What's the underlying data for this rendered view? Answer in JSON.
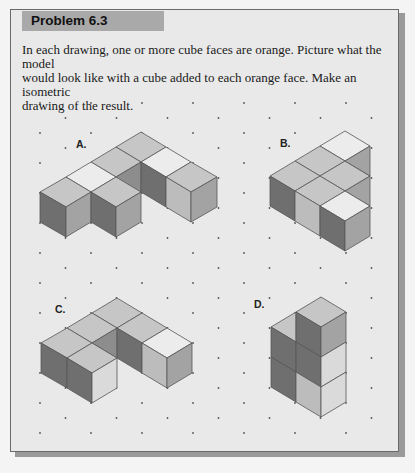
{
  "header": {
    "title": "Problem 6.3"
  },
  "instructions": {
    "line1": "In each drawing, one or more cube faces are orange. Picture what the model",
    "line2": "would look like with a cube added to each orange face. Make an isometric",
    "line3": "drawing of the result."
  },
  "colors": {
    "top": "#c6c6c6",
    "top_orange": "#ececec",
    "left_dark": "#6f6f6f",
    "right_medium": "#a3a3a3",
    "light": "#bcbcbc",
    "very_light": "#dadada",
    "mid_dark": "#8d8d8d",
    "edge": "#555555",
    "dot": "#555555"
  },
  "dot_grid": {
    "x0": 40,
    "y0": 103,
    "dx": 51,
    "dy": 15,
    "rows": 23,
    "x_max": 395
  },
  "drawings": [
    {
      "label": "A.",
      "label_pos": [
        76,
        148
      ],
      "faces": [
        {
          "c": "top",
          "p": [
            [
              141,
              132
            ],
            [
              166,
              147
            ],
            [
              141,
              162
            ],
            [
              116,
              147
            ]
          ]
        },
        {
          "c": "top",
          "p": [
            [
              116,
              147
            ],
            [
              141,
              162
            ],
            [
              116,
              177
            ],
            [
              91,
              162
            ]
          ]
        },
        {
          "c": "top_orange",
          "p": [
            [
              166,
              147
            ],
            [
              191,
              162
            ],
            [
              166,
              177
            ],
            [
              141,
              162
            ]
          ]
        },
        {
          "c": "top_orange",
          "p": [
            [
              91,
              162
            ],
            [
              116,
              177
            ],
            [
              91,
              192
            ],
            [
              66,
              177
            ]
          ]
        },
        {
          "c": "top",
          "p": [
            [
              191,
              162
            ],
            [
              217,
              177
            ],
            [
              191,
              192
            ],
            [
              166,
              177
            ]
          ]
        },
        {
          "c": "mid_dark",
          "p": [
            [
              116,
              177
            ],
            [
              141,
              162
            ],
            [
              141,
              192
            ],
            [
              116,
              207
            ]
          ]
        },
        {
          "c": "left_dark",
          "p": [
            [
              141,
              162
            ],
            [
              166,
              177
            ],
            [
              166,
              207
            ],
            [
              141,
              192
            ]
          ]
        },
        {
          "c": "light",
          "p": [
            [
              166,
              177
            ],
            [
              191,
              192
            ],
            [
              191,
              222
            ],
            [
              166,
              207
            ]
          ]
        },
        {
          "c": "right_medium",
          "p": [
            [
              191,
              192
            ],
            [
              217,
              177
            ],
            [
              217,
              207
            ],
            [
              191,
              222
            ]
          ]
        },
        {
          "c": "top",
          "p": [
            [
              66,
              177
            ],
            [
              91,
              192
            ],
            [
              66,
              207
            ],
            [
              40,
              192
            ]
          ]
        },
        {
          "c": "top",
          "p": [
            [
              116,
              177
            ],
            [
              141,
              192
            ],
            [
              116,
              207
            ],
            [
              91,
              192
            ]
          ]
        },
        {
          "c": "left_dark",
          "p": [
            [
              40,
              192
            ],
            [
              66,
              207
            ],
            [
              66,
              237
            ],
            [
              40,
              222
            ]
          ]
        },
        {
          "c": "right_medium",
          "p": [
            [
              66,
              207
            ],
            [
              91,
              192
            ],
            [
              91,
              222
            ],
            [
              66,
              237
            ]
          ]
        },
        {
          "c": "left_dark",
          "p": [
            [
              91,
              192
            ],
            [
              116,
              207
            ],
            [
              116,
              237
            ],
            [
              91,
              222
            ]
          ]
        },
        {
          "c": "right_medium",
          "p": [
            [
              116,
              207
            ],
            [
              141,
              192
            ],
            [
              141,
              222
            ],
            [
              116,
              237
            ]
          ]
        }
      ]
    },
    {
      "label": "B.",
      "label_pos": [
        280,
        147
      ],
      "faces": [
        {
          "c": "top_orange",
          "p": [
            [
              345,
              131
            ],
            [
              370,
              146
            ],
            [
              345,
              161
            ],
            [
              320,
              146
            ]
          ]
        },
        {
          "c": "top",
          "p": [
            [
              320,
              146
            ],
            [
              345,
              161
            ],
            [
              320,
              176
            ],
            [
              295,
              161
            ]
          ]
        },
        {
          "c": "top",
          "p": [
            [
              345,
              161
            ],
            [
              370,
              176
            ],
            [
              345,
              191
            ],
            [
              320,
              176
            ]
          ]
        },
        {
          "c": "right_medium",
          "p": [
            [
              345,
              161
            ],
            [
              370,
              146
            ],
            [
              370,
              176
            ]
          ]
        },
        {
          "c": "top",
          "p": [
            [
              295,
              161
            ],
            [
              320,
              176
            ],
            [
              295,
              191
            ],
            [
              270,
              176
            ]
          ]
        },
        {
          "c": "top",
          "p": [
            [
              320,
              176
            ],
            [
              345,
              191
            ],
            [
              320,
              206
            ],
            [
              295,
              191
            ]
          ]
        },
        {
          "c": "right_medium",
          "p": [
            [
              345,
              191
            ],
            [
              370,
              176
            ],
            [
              370,
              206
            ]
          ]
        },
        {
          "c": "top_orange",
          "p": [
            [
              345,
              191
            ],
            [
              370,
              206
            ],
            [
              345,
              221
            ],
            [
              320,
              206
            ]
          ]
        },
        {
          "c": "left_dark",
          "p": [
            [
              270,
              176
            ],
            [
              295,
              191
            ],
            [
              295,
              221
            ],
            [
              270,
              206
            ]
          ]
        },
        {
          "c": "light",
          "p": [
            [
              295,
              191
            ],
            [
              320,
              206
            ],
            [
              320,
              236
            ],
            [
              295,
              221
            ]
          ]
        },
        {
          "c": "left_dark",
          "p": [
            [
              320,
              206
            ],
            [
              345,
              221
            ],
            [
              345,
              251
            ],
            [
              320,
              236
            ]
          ]
        },
        {
          "c": "right_medium",
          "p": [
            [
              345,
              221
            ],
            [
              370,
              206
            ],
            [
              370,
              236
            ],
            [
              345,
              251
            ]
          ]
        }
      ]
    },
    {
      "label": "C.",
      "label_pos": [
        55,
        313
      ],
      "faces": [
        {
          "c": "top",
          "p": [
            [
              117,
              298
            ],
            [
              142,
              313
            ],
            [
              117,
              328
            ],
            [
              92,
              313
            ]
          ]
        },
        {
          "c": "top",
          "p": [
            [
              92,
              313
            ],
            [
              117,
              328
            ],
            [
              92,
              343
            ],
            [
              67,
              328
            ]
          ]
        },
        {
          "c": "top",
          "p": [
            [
              142,
              313
            ],
            [
              167,
              328
            ],
            [
              142,
              343
            ],
            [
              117,
              328
            ]
          ]
        },
        {
          "c": "mid_dark",
          "p": [
            [
              92,
              343
            ],
            [
              117,
              328
            ],
            [
              117,
              358
            ]
          ]
        },
        {
          "c": "left_dark",
          "p": [
            [
              117,
              328
            ],
            [
              142,
              343
            ],
            [
              142,
              373
            ],
            [
              117,
              358
            ]
          ]
        },
        {
          "c": "top_orange",
          "p": [
            [
              167,
              328
            ],
            [
              192,
              343
            ],
            [
              167,
              358
            ],
            [
              142,
              343
            ]
          ]
        },
        {
          "c": "light",
          "p": [
            [
              142,
              343
            ],
            [
              167,
              358
            ],
            [
              167,
              388
            ],
            [
              142,
              373
            ]
          ]
        },
        {
          "c": "right_medium",
          "p": [
            [
              167,
              358
            ],
            [
              192,
              343
            ],
            [
              192,
              373
            ],
            [
              167,
              388
            ]
          ]
        },
        {
          "c": "top",
          "p": [
            [
              67,
              328
            ],
            [
              92,
              343
            ],
            [
              67,
              358
            ],
            [
              41,
              343
            ]
          ]
        },
        {
          "c": "top",
          "p": [
            [
              92,
              343
            ],
            [
              117,
              358
            ],
            [
              92,
              373
            ],
            [
              67,
              358
            ]
          ]
        },
        {
          "c": "left_dark",
          "p": [
            [
              41,
              343
            ],
            [
              67,
              358
            ],
            [
              67,
              388
            ],
            [
              41,
              373
            ]
          ]
        },
        {
          "c": "left_dark",
          "p": [
            [
              67,
              358
            ],
            [
              92,
              373
            ],
            [
              92,
              403
            ],
            [
              67,
              388
            ]
          ]
        },
        {
          "c": "very_light",
          "p": [
            [
              92,
              373
            ],
            [
              117,
              358
            ],
            [
              117,
              388
            ],
            [
              92,
              403
            ]
          ]
        }
      ]
    },
    {
      "label": "D.",
      "label_pos": [
        254,
        308
      ],
      "faces": [
        {
          "c": "top",
          "p": [
            [
              271,
              327
            ],
            [
              296,
              312
            ],
            [
              296,
              342
            ]
          ]
        },
        {
          "c": "top",
          "p": [
            [
              296,
              312
            ],
            [
              321,
              297
            ],
            [
              346,
              312
            ],
            [
              321,
              327
            ]
          ]
        },
        {
          "c": "left_dark",
          "p": [
            [
              296,
              312
            ],
            [
              321,
              327
            ],
            [
              321,
              357
            ],
            [
              296,
              342
            ]
          ]
        },
        {
          "c": "right_medium",
          "p": [
            [
              321,
              327
            ],
            [
              346,
              312
            ],
            [
              346,
              342
            ],
            [
              321,
              357
            ]
          ]
        },
        {
          "c": "left_dark",
          "p": [
            [
              271,
              327
            ],
            [
              296,
              342
            ],
            [
              296,
              372
            ],
            [
              271,
              357
            ]
          ]
        },
        {
          "c": "left_dark",
          "p": [
            [
              271,
              357
            ],
            [
              296,
              372
            ],
            [
              296,
              402
            ],
            [
              271,
              387
            ]
          ]
        },
        {
          "c": "left_dark",
          "p": [
            [
              296,
              342
            ],
            [
              321,
              357
            ],
            [
              321,
              387
            ],
            [
              296,
              372
            ]
          ]
        },
        {
          "c": "light",
          "p": [
            [
              296,
              372
            ],
            [
              321,
              387
            ],
            [
              321,
              417
            ],
            [
              296,
              402
            ]
          ]
        },
        {
          "c": "very_light",
          "p": [
            [
              321,
              357
            ],
            [
              346,
              342
            ],
            [
              346,
              372
            ],
            [
              321,
              387
            ]
          ]
        },
        {
          "c": "very_light",
          "p": [
            [
              321,
              387
            ],
            [
              346,
              372
            ],
            [
              346,
              402
            ],
            [
              321,
              417
            ]
          ]
        }
      ]
    }
  ]
}
